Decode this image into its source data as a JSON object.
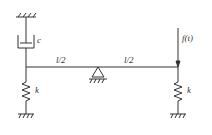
{
  "diagram": {
    "type": "mechanical vibration system schematic",
    "colors": {
      "stroke": "#333333",
      "background": "#ffffff"
    },
    "labels": {
      "damper": "c",
      "left_segment": "l/2",
      "right_segment": "l/2",
      "force": "f(t)",
      "left_spring": "k",
      "right_spring": "k"
    },
    "components": [
      {
        "id": "top-ground",
        "kind": "fixed support (hatched)",
        "position": "above left end"
      },
      {
        "id": "damper",
        "kind": "viscous damper",
        "label": "c",
        "connects": "top-ground to beam left end"
      },
      {
        "id": "beam",
        "kind": "rigid beam",
        "length_label": "l"
      },
      {
        "id": "pivot",
        "kind": "pin/triangle support",
        "position": "beam midpoint"
      },
      {
        "id": "left-spring",
        "kind": "spring",
        "label": "k",
        "connects": "beam left end to ground"
      },
      {
        "id": "right-spring",
        "kind": "spring",
        "label": "k",
        "connects": "beam right end to ground"
      },
      {
        "id": "force",
        "kind": "applied force arrow (downward)",
        "label": "f(t)",
        "position": "beam right end"
      }
    ]
  }
}
